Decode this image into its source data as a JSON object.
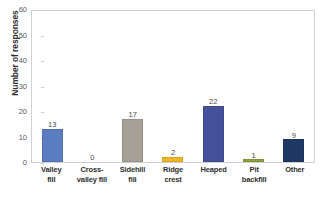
{
  "chart_data": {
    "type": "bar",
    "title": "",
    "xlabel": "",
    "ylabel": "Number of responses",
    "ylim": [
      0,
      60
    ],
    "yticks": [
      0,
      10,
      20,
      30,
      40,
      50,
      60
    ],
    "grid": false,
    "legend": "none",
    "categories": [
      "Valley fill",
      "Cross-valley fill",
      "Sidehill fill",
      "Ridge crest",
      "Heaped",
      "Pit backfill",
      "Other"
    ],
    "category_lines": [
      [
        "Valley",
        "fill"
      ],
      [
        "Cross-",
        "valley fill"
      ],
      [
        "Sidehill",
        "fill"
      ],
      [
        "Ridge",
        "crest"
      ],
      [
        "Heaped",
        ""
      ],
      [
        "Pit",
        "backfill"
      ],
      [
        "Other",
        ""
      ]
    ],
    "values": [
      13,
      0,
      17,
      2,
      22,
      1,
      9
    ],
    "value_labels": [
      "13",
      "0",
      "17",
      "2",
      "22",
      "1",
      "9"
    ],
    "colors": [
      "#5b7cc0",
      "#ffffff",
      "#a6a196",
      "#f2b524",
      "#46519b",
      "#8aa43a",
      "#1f3864"
    ]
  },
  "axis": {
    "y_title": "Number of responses",
    "tick_labels": [
      "60",
      "50",
      "40",
      "30",
      "20",
      "10",
      "0"
    ]
  },
  "caption": {
    "clipped_text": ""
  }
}
